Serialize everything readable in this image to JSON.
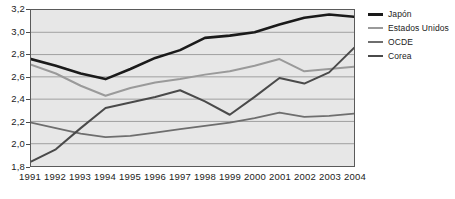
{
  "chart_data": {
    "type": "line",
    "title": "",
    "xlabel": "",
    "ylabel": "",
    "x": [
      1991,
      1992,
      1993,
      1994,
      1995,
      1996,
      1997,
      1998,
      1999,
      2000,
      2001,
      2002,
      2003,
      2004
    ],
    "categories": [
      "1991",
      "1992",
      "1993",
      "1994",
      "1995",
      "1996",
      "1997",
      "1998",
      "1999",
      "2000",
      "2001",
      "2002",
      "2003",
      "2004"
    ],
    "ylim": [
      1.8,
      3.2
    ],
    "xlim": [
      1991,
      2004
    ],
    "yticks": [
      "1,8",
      "2,0",
      "2,2",
      "2,4",
      "2,6",
      "2,8",
      "3,0",
      "3,2"
    ],
    "ytick_values": [
      1.8,
      2.0,
      2.2,
      2.4,
      2.6,
      2.8,
      3.0,
      3.2
    ],
    "grid": true,
    "grid_axis": "y",
    "legend_position": "right",
    "plot_background": "#e7e7e7",
    "series": [
      {
        "name": "Japón",
        "color": "#1a1a1a",
        "width": 2.6,
        "values": [
          2.76,
          2.7,
          2.63,
          2.58,
          2.67,
          2.77,
          2.84,
          2.95,
          2.97,
          3.0,
          3.07,
          3.13,
          3.16,
          3.14
        ]
      },
      {
        "name": "Estados Unidos",
        "color": "#9a9a9a",
        "width": 2.0,
        "values": [
          2.71,
          2.63,
          2.52,
          2.43,
          2.5,
          2.55,
          2.58,
          2.62,
          2.65,
          2.7,
          2.76,
          2.65,
          2.67,
          2.69
        ]
      },
      {
        "name": "OCDE",
        "color": "#6e6e6e",
        "width": 1.8,
        "values": [
          2.19,
          2.14,
          2.09,
          2.06,
          2.07,
          2.1,
          2.13,
          2.16,
          2.19,
          2.23,
          2.28,
          2.24,
          2.25,
          2.27
        ]
      },
      {
        "name": "Corea",
        "color": "#4a4a4a",
        "width": 2.0,
        "values": [
          1.84,
          1.95,
          2.14,
          2.32,
          2.37,
          2.42,
          2.48,
          2.38,
          2.26,
          2.42,
          2.59,
          2.54,
          2.64,
          2.86
        ]
      }
    ]
  },
  "legend": {
    "items": [
      {
        "label": "Japón",
        "color": "#1a1a1a"
      },
      {
        "label": "Estados Unidos",
        "color": "#9a9a9a"
      },
      {
        "label": "OCDE",
        "color": "#6e6e6e"
      },
      {
        "label": "Corea",
        "color": "#4a4a4a"
      }
    ]
  },
  "axes": {
    "y_labels": [
      "3,2",
      "3,0",
      "2,8",
      "2,6",
      "2,4",
      "2,2",
      "2,0",
      "1,8"
    ],
    "x_labels": [
      "1991",
      "1992",
      "1993",
      "1994",
      "1995",
      "1996",
      "1997",
      "1998",
      "1999",
      "2000",
      "2001",
      "2002",
      "2003",
      "2004"
    ]
  }
}
